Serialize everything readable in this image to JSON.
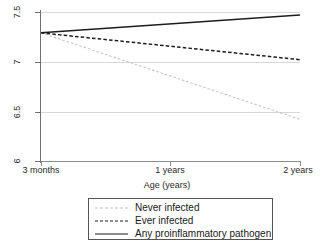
{
  "chart_data": {
    "type": "line",
    "title": "",
    "xlabel": "Age (years)",
    "ylabel": "",
    "xlim": [
      0.25,
      2.0
    ],
    "ylim": [
      6,
      7.5
    ],
    "grid": true,
    "legend_position": "bottom",
    "x_tick_labels": [
      "3 months",
      "1 years",
      "2 years"
    ],
    "x_tick_values": [
      0.25,
      1,
      2
    ],
    "y_tick_labels": [
      "7.5",
      "7",
      "6.5",
      "6"
    ],
    "y_tick_values": [
      7.5,
      7,
      6.5,
      6
    ],
    "x": [
      0.25,
      2
    ],
    "series": [
      {
        "name": "Never infected",
        "style": "dotted",
        "color": "#c4c4c4",
        "values": [
          7.29,
          6.42
        ]
      },
      {
        "name": "Ever infected",
        "style": "dashed",
        "color": "#1c1c1c",
        "values": [
          7.29,
          7.02
        ]
      },
      {
        "name": "Any proinflammatory pathogen",
        "style": "solid",
        "color": "#1c1c1c",
        "values": [
          7.29,
          7.47
        ]
      }
    ]
  },
  "axes": {
    "x_title": "Age (years)",
    "x_ticks": [
      {
        "label": "3 months"
      },
      {
        "label": "1 years"
      },
      {
        "label": "2 years"
      }
    ],
    "y_ticks": [
      {
        "label": "7.5"
      },
      {
        "label": "7"
      },
      {
        "label": "6.5"
      },
      {
        "label": "6"
      }
    ]
  },
  "legend": {
    "entries": [
      {
        "label": "Never infected"
      },
      {
        "label": "Ever infected"
      },
      {
        "label": "Any proinflammatory pathogen"
      }
    ]
  },
  "colors": {
    "line_dark": "#1c1c1c",
    "line_light": "#c4c4c4",
    "grid": "#d8d8d8",
    "axis": "#6f6f6f",
    "background": "#ffffff"
  }
}
